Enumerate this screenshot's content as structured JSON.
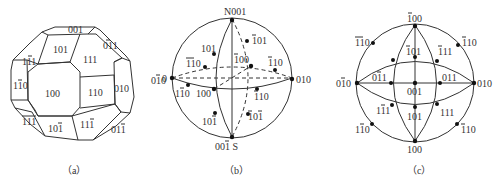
{
  "figure": {
    "panels": [
      {
        "id": "a",
        "caption": "（a）",
        "type": "crystal-polyhedron",
        "faces": [
          "001",
          "101",
          "111",
          "01̄1",
          "1̄11",
          "11̄0",
          "100",
          "110",
          "010",
          "1̄11̄",
          "101̄",
          "111̄",
          "011̄"
        ],
        "outside_label": "01̄0"
      },
      {
        "id": "b",
        "caption": "（b）",
        "type": "sphere-projection",
        "poles": {
          "north": "N001",
          "south": "001̄ S",
          "left": "01̄0",
          "right": "010"
        },
        "labels": [
          "101",
          "1̄01",
          "1̄1̄0",
          "1̄00",
          "1̄10",
          "11̄0",
          "100",
          "110",
          "101̄",
          "1̄01̄"
        ]
      },
      {
        "id": "c",
        "caption": "（c）",
        "type": "stereographic-projection",
        "labels": {
          "top": "1̄00",
          "top_left": "1̄1̄0",
          "top_right": "1̄10",
          "upper_mid": "1̄01",
          "upper_right": "1̄11",
          "left": "01̄0",
          "right": "010",
          "center_left": "01̄1",
          "center_right": "011",
          "center": "001",
          "lower_left": "11̄1",
          "lower_mid": "101",
          "lower_right": "111",
          "bottom_left": "11̄0",
          "bottom_right": "110",
          "bottom": "100"
        }
      }
    ]
  }
}
